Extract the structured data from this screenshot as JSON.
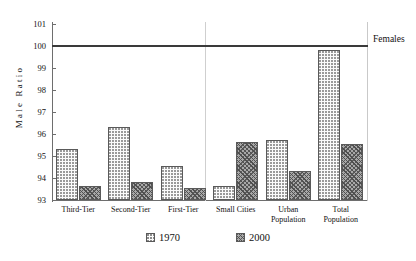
{
  "chart_data": {
    "type": "bar",
    "title": "",
    "xlabel": "",
    "ylabel": "Male Ratio",
    "ylim": [
      93,
      101
    ],
    "yticks": [
      101,
      100,
      99,
      98,
      97,
      96,
      95,
      94,
      93
    ],
    "grid": false,
    "legend_position": "bottom",
    "categories": [
      "Third-Tier",
      "Second-Tier",
      "First-Tier",
      "Small Cities",
      "Urban Population",
      "Total Population"
    ],
    "category_lines": [
      [
        "Third-Tier"
      ],
      [
        "Second-Tier"
      ],
      [
        "First-Tier"
      ],
      [
        "Small Cities"
      ],
      [
        "Urban",
        "Population"
      ],
      [
        "Total",
        "Population"
      ]
    ],
    "series": [
      {
        "name": "1970",
        "values": [
          95.3,
          96.3,
          94.55,
          93.65,
          95.75,
          99.8
        ]
      },
      {
        "name": "2000",
        "values": [
          93.65,
          93.8,
          93.55,
          95.65,
          94.3,
          95.55
        ]
      }
    ],
    "annotations": [
      {
        "name": "females-reference-line",
        "label": "Females",
        "value": 100,
        "orientation": "horizontal"
      }
    ],
    "group_divider_after_category": "First-Tier"
  },
  "legend": {
    "entries": [
      {
        "label": "1970",
        "swatch": "dotted-light-swatch"
      },
      {
        "label": "2000",
        "swatch": "hatched-dark-swatch"
      }
    ]
  },
  "colors": {
    "axis": "#6e6e6e",
    "reference_line": "#3a3a3a",
    "series_1970_fill": "#fbfbfb",
    "series_2000_fill": "#a8a8a8",
    "text": "#111111",
    "background": "#ffffff"
  }
}
